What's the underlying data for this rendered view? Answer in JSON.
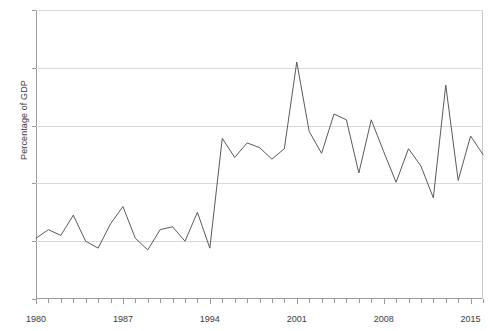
{
  "chart_data": {
    "type": "line",
    "title": "",
    "xlabel": "",
    "ylabel": "Percentage of GDP",
    "xlim": [
      1980,
      2016
    ],
    "ylim": [
      0,
      5
    ],
    "grid": true,
    "legend": false,
    "line_color": "#5a5a5a",
    "y_ticks": [
      0,
      1,
      2,
      3,
      4,
      5
    ],
    "y_tick_labels": [
      "0",
      "1",
      "2",
      "3",
      "4",
      "5"
    ],
    "x_ticks": [
      1980,
      1987,
      1994,
      2001,
      2008,
      2015
    ],
    "x_tick_labels": [
      "1980",
      "1987",
      "1994",
      "2001",
      "2008",
      "2015"
    ],
    "x_minor_tick_step": 1,
    "series": [
      {
        "name": "Percentage of GDP",
        "x": [
          1980,
          1981,
          1982,
          1983,
          1984,
          1985,
          1986,
          1987,
          1988,
          1989,
          1990,
          1991,
          1992,
          1993,
          1994,
          1995,
          1996,
          1997,
          1998,
          1999,
          2000,
          2001,
          2002,
          2003,
          2004,
          2005,
          2006,
          2007,
          2008,
          2009,
          2010,
          2011,
          2012,
          2013,
          2014,
          2015,
          2016
        ],
        "values": [
          1.05,
          1.2,
          1.1,
          1.45,
          1.0,
          0.88,
          1.3,
          1.6,
          1.05,
          0.85,
          1.2,
          1.25,
          1.0,
          1.5,
          0.88,
          2.78,
          2.45,
          2.7,
          2.62,
          2.42,
          2.6,
          4.1,
          2.9,
          2.52,
          3.2,
          3.1,
          2.18,
          3.1,
          2.55,
          2.02,
          2.6,
          2.3,
          1.75,
          3.7,
          2.05,
          2.82,
          2.5
        ]
      }
    ]
  },
  "axes": {
    "y_title": "Percentage of GDP"
  }
}
